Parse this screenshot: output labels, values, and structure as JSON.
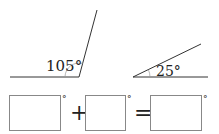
{
  "angles": [
    {
      "label": "105°",
      "value": 105
    },
    {
      "label": "25°",
      "value": 25
    }
  ],
  "equation": {
    "operator_plus": "+",
    "operator_equals": "=",
    "degree_symbol": "°",
    "boxes": [
      "",
      "",
      ""
    ]
  },
  "colors": {
    "line": "#333333",
    "box": "#888888"
  }
}
